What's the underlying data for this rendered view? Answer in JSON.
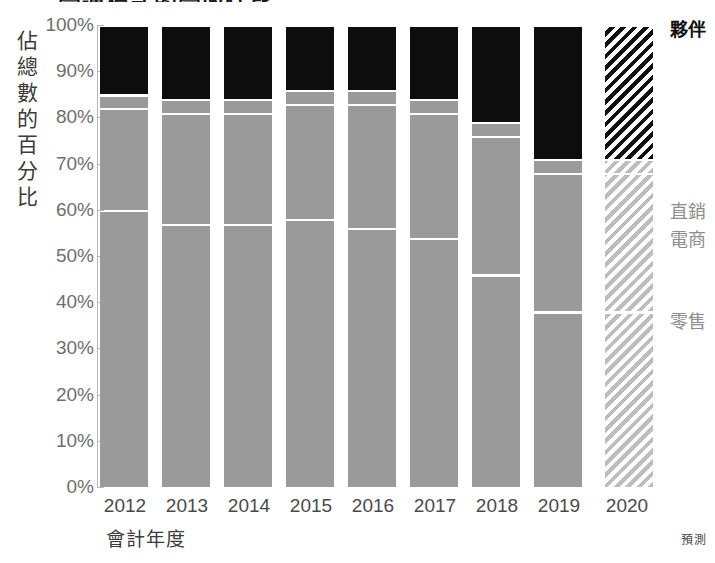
{
  "chart_data": {
    "type": "bar",
    "subtype": "100% stacked bar",
    "title": "營運模式的營收佔比",
    "xlabel": "會計年度",
    "ylabel": "佔總數的百分比",
    "ylim": [
      0,
      100
    ],
    "yticks": [
      "0%",
      "10%",
      "20%",
      "30%",
      "40%",
      "50%",
      "60%",
      "70%",
      "80%",
      "90%",
      "100%"
    ],
    "grid": false,
    "legend_position": "right",
    "categories": [
      "2012",
      "2013",
      "2014",
      "2015",
      "2016",
      "2017",
      "2018",
      "2019",
      "2020"
    ],
    "series": [
      {
        "name": "零售",
        "values": [
          60,
          57,
          57,
          58,
          56,
          54,
          46,
          38,
          38
        ]
      },
      {
        "name": "電商",
        "values": [
          22,
          24,
          24,
          25,
          27,
          27,
          30,
          30,
          30
        ]
      },
      {
        "name": "直銷",
        "values": [
          3,
          3,
          3,
          3,
          3,
          3,
          3,
          3,
          3
        ]
      },
      {
        "name": "夥伴",
        "values": [
          15,
          16,
          16,
          14,
          14,
          16,
          21,
          29,
          29
        ]
      }
    ],
    "forecast_category": "2020",
    "forecast_note": "預測",
    "annotations": [],
    "colors": {
      "partner": "#0d0d0d",
      "direct": "#9a9a9a",
      "ecom": "#9a9a9a",
      "retail": "#9a9a9a",
      "axis": "#b8b8b8",
      "tick_text": "#6e6e6e"
    }
  },
  "legend": {
    "partner": "夥伴",
    "direct": "直銷",
    "ecom": "電商",
    "retail": "零售"
  },
  "axes": {
    "y_title": "佔總數的百分比",
    "x_title": "會計年度"
  },
  "footer": {
    "forecast": "預測"
  }
}
